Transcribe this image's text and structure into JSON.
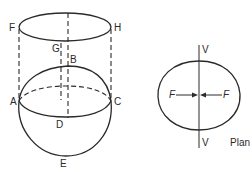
{
  "figure": {
    "left_view": {
      "points": {
        "F": "F",
        "G": "G",
        "H": "H",
        "B": "B",
        "A": "A",
        "C": "C",
        "D": "D",
        "E": "E"
      }
    },
    "plan_view": {
      "axis_top": "V",
      "axis_bottom": "V",
      "force_left": "F",
      "force_right": "F",
      "caption": "Plan"
    }
  },
  "colors": {
    "line": "#2a2a2a",
    "background": "#ffffff"
  }
}
